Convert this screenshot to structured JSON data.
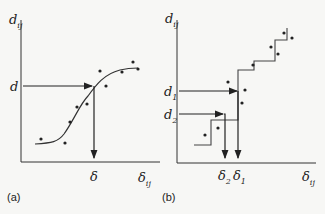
{
  "panel_a": {
    "caption": "(a)",
    "y_axis_label": "d",
    "y_axis_sub": "ij",
    "x_axis_label": "δ",
    "x_axis_sub": "ij",
    "y_marker": "d",
    "x_marker": "δ",
    "description": "Monotone smooth regression curve through scatter of dissimilarities vs distances; arrow from d to curve then down to δ"
  },
  "panel_b": {
    "caption": "(b)",
    "y_axis_label": "d",
    "y_axis_sub": "ij",
    "x_axis_label": "δ",
    "x_axis_sub": "ij",
    "y_marker_1": "d",
    "y_marker_1_sub": "1",
    "y_marker_2": "d",
    "y_marker_2_sub": "2",
    "x_marker_1": "δ",
    "x_marker_1_sub": "1",
    "x_marker_2": "δ",
    "x_marker_2_sub": "2",
    "description": "Monotone step function fit; arrows from d1 and d2 to steps then down to δ1 and δ2"
  }
}
